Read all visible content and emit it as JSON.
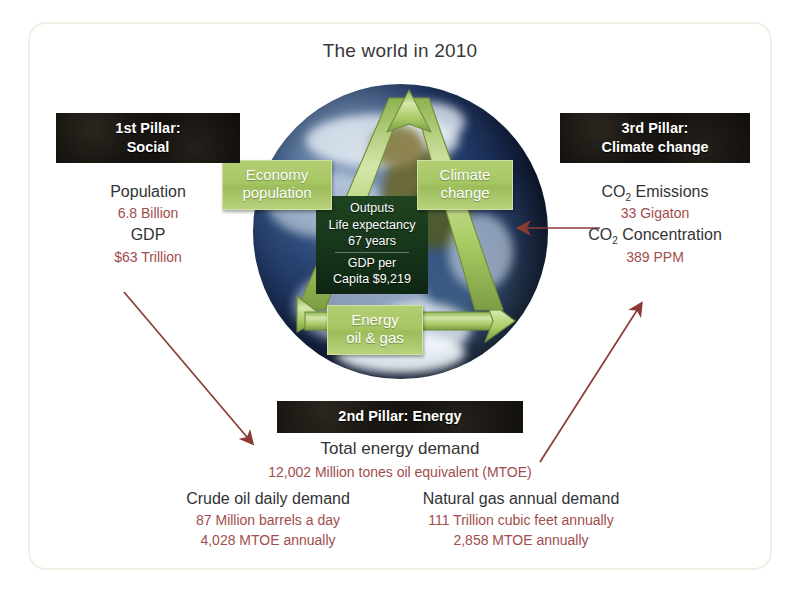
{
  "figure": {
    "title": "The world in 2010",
    "accent_red": "#9f4d4d",
    "arrow_color": "#8a3b34",
    "chip_green": "#a6c663",
    "banner_black": "#0b0907"
  },
  "triangle": {
    "chips": [
      {
        "key": "economy",
        "line1": "Economy",
        "line2": "population"
      },
      {
        "key": "climate",
        "line1": "Climate",
        "line2": "change"
      },
      {
        "key": "energy",
        "line1": "Energy",
        "line2": "oil & gas"
      }
    ],
    "outputs": {
      "heading": "Outputs",
      "line1": "Life expectancy",
      "line2": "67 years",
      "line3": "GDP per",
      "line4": "Capita $9,219"
    }
  },
  "pillars": {
    "social": {
      "banner_line1": "1st Pillar:",
      "banner_line2": "Social",
      "metric1_label": "Population",
      "metric1_value": "6.8 Billion",
      "metric2_label": "GDP",
      "metric2_value": "$63 Trillion"
    },
    "climate": {
      "banner_line1": "3rd Pillar:",
      "banner_line2": "Climate change",
      "metric1_label_pre": "CO",
      "metric1_label_sub": "2",
      "metric1_label_post": " Emissions",
      "metric1_value": "33 Gigaton",
      "metric2_label_pre": "CO",
      "metric2_label_sub": "2",
      "metric2_label_post": " Concentration",
      "metric2_value": "389 PPM"
    },
    "energy": {
      "banner": "2nd Pillar: Energy",
      "total_label": "Total energy demand",
      "total_value": "12,002 Million tones oil equivalent (MTOE)",
      "oil_label": "Crude oil daily demand",
      "oil_value1": "87 Million barrels a day",
      "oil_value2": "4,028 MTOE annually",
      "gas_label": "Natural gas annual demand",
      "gas_value1": "111 Trillion cubic feet annually",
      "gas_value2": "2,858 MTOE annually"
    }
  }
}
